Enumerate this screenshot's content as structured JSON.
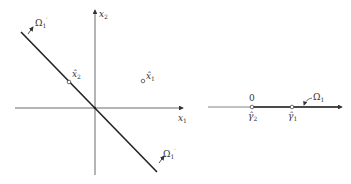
{
  "left_panel": {
    "axes": {
      "x_label": "x",
      "x_sub": "1",
      "y_label": "x",
      "y_sub": "2"
    },
    "points": [
      {
        "label": "x̂",
        "sub": "1",
        "desc": "x-hat-1"
      },
      {
        "label": "x̂",
        "sub": "2",
        "desc": "x-hat-2"
      }
    ],
    "boundary_labels": [
      {
        "label": "Ω",
        "sub": "1",
        "sup": "′"
      },
      {
        "label": "Ω",
        "sub": "1",
        "sup": "′"
      }
    ]
  },
  "right_panel": {
    "origin_label": "0",
    "points": [
      {
        "label": "γ̂",
        "sub": "2"
      },
      {
        "label": "γ̂",
        "sub": "1"
      }
    ],
    "region_label": {
      "label": "Ω",
      "sub": "1"
    }
  },
  "colors": {
    "ink": "#333333",
    "background": "#ffffff"
  }
}
